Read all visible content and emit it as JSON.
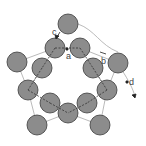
{
  "diagram": {
    "labels": {
      "a": "a",
      "b": "b",
      "c": "c",
      "d": "d"
    },
    "colors": {
      "circle_fill": "#8c8c8c",
      "circle_stroke": "#3a3a3a",
      "line": "#9a9a9a",
      "dash": "#333333",
      "arrow": "#222222"
    },
    "circle_radius": 10
  }
}
